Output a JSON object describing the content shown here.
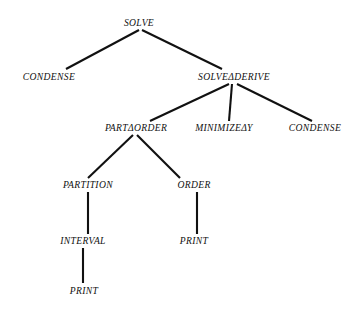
{
  "diagram": {
    "type": "tree",
    "background_color": "#ffffff",
    "text_color": "#111111",
    "edge_color": "#111111",
    "nodes": [
      {
        "id": "n0",
        "label": "SOLVE",
        "x": 139,
        "y": 23,
        "level": 0
      },
      {
        "id": "n1",
        "label": "CONDENSE",
        "x": 49,
        "y": 77,
        "level": 1
      },
      {
        "id": "n2",
        "label": "SOLVEΔDERIVE",
        "x": 234,
        "y": 77,
        "level": 1
      },
      {
        "id": "n3",
        "label": "PARTΔORDER",
        "x": 136,
        "y": 128,
        "level": 2
      },
      {
        "id": "n4",
        "label": "MINIMIZEΔY",
        "x": 224,
        "y": 128,
        "level": 2
      },
      {
        "id": "n5",
        "label": "CONDENSE",
        "x": 315,
        "y": 128,
        "level": 2
      },
      {
        "id": "n6",
        "label": "PARTITION",
        "x": 88,
        "y": 185,
        "level": 3
      },
      {
        "id": "n7",
        "label": "ORDER",
        "x": 194,
        "y": 185,
        "level": 3
      },
      {
        "id": "n8",
        "label": "INTERVAL",
        "x": 83,
        "y": 241,
        "level": 4
      },
      {
        "id": "n9",
        "label": "PRINT",
        "x": 194,
        "y": 241,
        "level": 4
      },
      {
        "id": "n10",
        "label": "PRINT",
        "x": 84,
        "y": 291,
        "level": 5
      }
    ],
    "edges": [
      {
        "id": "e0",
        "from": "n0",
        "to": "n1",
        "x1": 139,
        "y1": 30,
        "x2": 66,
        "y2": 69
      },
      {
        "id": "e1",
        "from": "n0",
        "to": "n2",
        "x1": 142,
        "y1": 30,
        "x2": 222,
        "y2": 69
      },
      {
        "id": "e2",
        "from": "n2",
        "to": "n3",
        "x1": 229,
        "y1": 84,
        "x2": 150,
        "y2": 121
      },
      {
        "id": "e3",
        "from": "n2",
        "to": "n4",
        "x1": 232,
        "y1": 84,
        "x2": 229,
        "y2": 121
      },
      {
        "id": "e4",
        "from": "n2",
        "to": "n5",
        "x1": 237,
        "y1": 84,
        "x2": 312,
        "y2": 121
      },
      {
        "id": "e5",
        "from": "n3",
        "to": "n6",
        "x1": 133,
        "y1": 135,
        "x2": 88,
        "y2": 178
      },
      {
        "id": "e6",
        "from": "n3",
        "to": "n7",
        "x1": 137,
        "y1": 135,
        "x2": 180,
        "y2": 178
      },
      {
        "id": "e7",
        "from": "n6",
        "to": "n8",
        "x1": 88,
        "y1": 192,
        "x2": 88,
        "y2": 234
      },
      {
        "id": "e8",
        "from": "n7",
        "to": "n9",
        "x1": 197,
        "y1": 192,
        "x2": 197,
        "y2": 234
      },
      {
        "id": "e9",
        "from": "n8",
        "to": "n10",
        "x1": 83,
        "y1": 248,
        "x2": 83,
        "y2": 283
      }
    ]
  }
}
